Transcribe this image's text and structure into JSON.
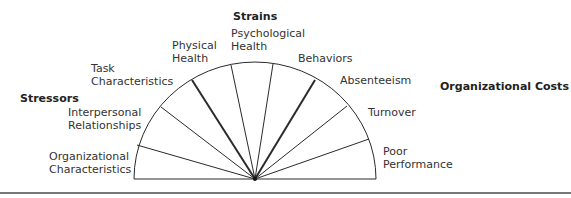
{
  "headers": {
    "left": "Stressors",
    "top": "Strains",
    "right": "Organizational Costs"
  },
  "labels": [
    {
      "line1": "Organizational",
      "line2": "Characteristics"
    },
    {
      "line1": "Interpersonal",
      "line2": "Relationships"
    },
    {
      "line1": "Task",
      "line2": "Characteristics"
    },
    {
      "line1": "Physical",
      "line2": "Health"
    },
    {
      "line1": "Psychological",
      "line2": "Health"
    },
    {
      "line1": "Behaviors",
      "line2": ""
    },
    {
      "line1": "Absenteeism",
      "line2": ""
    },
    {
      "line1": "Turnover",
      "line2": ""
    },
    {
      "line1": "Poor",
      "line2": "Performance"
    }
  ],
  "colors": {
    "line": "#2a2a2a",
    "text": "#333333"
  }
}
